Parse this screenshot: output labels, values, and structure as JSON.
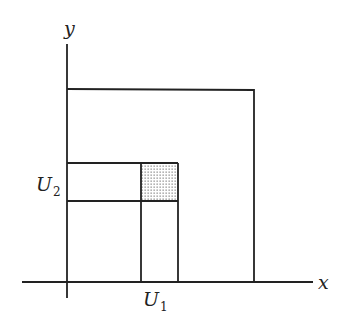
{
  "diagram": {
    "axes": {
      "x_label": "x",
      "y_label": "y"
    },
    "labels": {
      "u1_main": "U",
      "u1_sub": "1",
      "u2_main": "U",
      "u2_sub": "2"
    },
    "shapes": {
      "outer_rectangle": {
        "x1": 67,
        "y1": 89,
        "x2": 254,
        "y2": 282
      },
      "horizontal_strip_U2": {
        "x1": 67,
        "y1": 163,
        "x2": 178,
        "y2": 201
      },
      "vertical_strip_U1": {
        "x1": 141,
        "y1": 163,
        "x2": 178,
        "y2": 282
      },
      "shaded_intersection": {
        "x1": 141,
        "y1": 163,
        "x2": 178,
        "y2": 201
      }
    },
    "colors": {
      "stroke": "#222222",
      "shade_dot": "#8a8a8a",
      "background": "#ffffff"
    }
  }
}
